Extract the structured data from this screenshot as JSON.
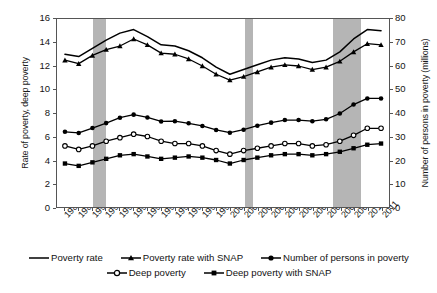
{
  "chart_data": {
    "type": "line",
    "title": "",
    "x": [
      1988,
      1989,
      1990,
      1991,
      1992,
      1993,
      1994,
      1995,
      1996,
      1997,
      1998,
      1999,
      2000,
      2001,
      2002,
      2003,
      2004,
      2005,
      2006,
      2007,
      2008,
      2009,
      2010,
      2011
    ],
    "xlabel": "",
    "ylabel": "Rate of poverty, deep poverty",
    "ylabel_right": "Number of persons in poverty (millions)",
    "ylim": [
      0,
      16
    ],
    "yticks": [
      0,
      2,
      4,
      6,
      8,
      10,
      12,
      14,
      16
    ],
    "ylim_right": [
      0,
      80
    ],
    "yticks_right": [
      0,
      10,
      20,
      30,
      40,
      50,
      60,
      70,
      80
    ],
    "grid": false,
    "legend_position": "bottom",
    "shaded_regions": [
      {
        "label": "recession",
        "start": 1990,
        "end": 1991
      },
      {
        "label": "recession",
        "start": 2001,
        "end": 2001.6
      },
      {
        "label": "recession",
        "start": 2007.4,
        "end": 2009.4
      }
    ],
    "shaded_color": "#b5b5b5",
    "series": [
      {
        "name": "Poverty rate",
        "axis": "left",
        "marker": "none",
        "values": [
          13.0,
          12.8,
          13.5,
          14.2,
          14.8,
          15.1,
          14.5,
          13.8,
          13.7,
          13.3,
          12.7,
          11.9,
          11.3,
          11.7,
          12.1,
          12.5,
          12.7,
          12.6,
          12.3,
          12.5,
          13.2,
          14.3,
          15.1,
          15.0
        ]
      },
      {
        "name": "Poverty rate with SNAP",
        "axis": "left",
        "marker": "triangle",
        "values": [
          12.5,
          12.2,
          12.9,
          13.4,
          13.7,
          14.3,
          13.8,
          13.1,
          13.0,
          12.6,
          12.0,
          11.3,
          10.8,
          11.1,
          11.5,
          11.9,
          12.1,
          12.0,
          11.7,
          11.9,
          12.4,
          13.2,
          13.9,
          13.8
        ]
      },
      {
        "name": "Number of persons in poverty",
        "axis": "right",
        "marker": "circle-filled",
        "values": [
          32.0,
          31.5,
          33.6,
          35.7,
          38.0,
          39.3,
          38.1,
          36.4,
          36.5,
          35.6,
          34.5,
          32.8,
          31.6,
          32.9,
          34.6,
          35.9,
          37.0,
          37.0,
          36.5,
          37.3,
          39.8,
          43.6,
          46.2,
          46.2
        ]
      },
      {
        "name": "Deep poverty",
        "axis": "left",
        "marker": "circle-open",
        "values": [
          5.2,
          4.9,
          5.2,
          5.6,
          5.9,
          6.2,
          6.0,
          5.6,
          5.4,
          5.4,
          5.2,
          4.8,
          4.5,
          4.8,
          5.0,
          5.2,
          5.4,
          5.4,
          5.2,
          5.3,
          5.6,
          6.1,
          6.7,
          6.7
        ]
      },
      {
        "name": "Deep poverty with SNAP",
        "axis": "left",
        "marker": "square-filled",
        "values": [
          3.7,
          3.5,
          3.8,
          4.1,
          4.4,
          4.5,
          4.3,
          4.1,
          4.2,
          4.3,
          4.2,
          4.0,
          3.7,
          4.0,
          4.2,
          4.4,
          4.5,
          4.5,
          4.4,
          4.5,
          4.7,
          5.0,
          5.3,
          5.4
        ]
      }
    ]
  },
  "legend": {
    "rows": [
      [
        "Poverty rate",
        "Poverty rate with SNAP",
        "Number of persons in poverty"
      ],
      [
        "Deep poverty",
        "Deep poverty with SNAP"
      ]
    ]
  }
}
